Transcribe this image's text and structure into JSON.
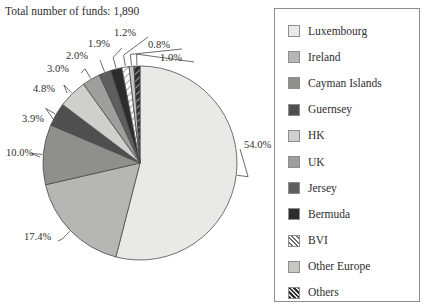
{
  "title": "Total number of funds: 1,890",
  "chart_data": {
    "type": "pie",
    "title": "Total number of funds: 1,890",
    "total_label": "Total number of funds",
    "total_value": "1,890",
    "legend_position": "right",
    "grid": false,
    "categories": [
      "Luxembourg",
      "Ireland",
      "Cayman Islands",
      "Guernsey",
      "HK",
      "UK",
      "Jersey",
      "Bermuda",
      "BVI",
      "Other Europe",
      "Others"
    ],
    "values": [
      54.0,
      17.4,
      10.0,
      3.9,
      4.8,
      3.0,
      2.0,
      1.9,
      1.2,
      0.8,
      1.0
    ],
    "value_labels": [
      "54.0%",
      "17.4%",
      "10.0%",
      "3.9%",
      "4.8%",
      "3.0%",
      "2.0%",
      "1.9%",
      "1.2%",
      "0.8%",
      "1.0%"
    ],
    "colors": [
      "#e9e9e7",
      "#b6b6b4",
      "#8f8f8d",
      "#4f4f4f",
      "#cfcfcd",
      "#9e9e9c",
      "#5e5e5e",
      "#2c2c2c",
      "#ffffff",
      "#c6c6c4",
      "#3a3a3a"
    ],
    "fills": [
      "solid",
      "solid",
      "solid",
      "solid",
      "solid",
      "solid",
      "solid",
      "solid",
      "hatch-light",
      "solid",
      "hatch-dark"
    ],
    "start_angle_deg": 0,
    "direction": "clockwise",
    "xlabel": "",
    "ylabel": ""
  },
  "legend": {
    "items": [
      {
        "label": "Luxembourg",
        "color": "#e9e9e7",
        "fill": "solid"
      },
      {
        "label": "Ireland",
        "color": "#b6b6b4",
        "fill": "solid"
      },
      {
        "label": "Cayman Islands",
        "color": "#8f8f8d",
        "fill": "solid"
      },
      {
        "label": "Guernsey",
        "color": "#4f4f4f",
        "fill": "solid"
      },
      {
        "label": "HK",
        "color": "#cfcfcd",
        "fill": "solid"
      },
      {
        "label": "UK",
        "color": "#9e9e9c",
        "fill": "solid"
      },
      {
        "label": "Jersey",
        "color": "#5e5e5e",
        "fill": "solid"
      },
      {
        "label": "Bermuda",
        "color": "#2c2c2c",
        "fill": "solid"
      },
      {
        "label": "BVI",
        "color": "#ffffff",
        "fill": "hatch-light"
      },
      {
        "label": "Other Europe",
        "color": "#c6c6c4",
        "fill": "solid"
      },
      {
        "label": "Others",
        "color": "#3a3a3a",
        "fill": "hatch-dark"
      }
    ]
  },
  "pct_labels": [
    {
      "text": "54.0%",
      "x": 244,
      "y": 139
    },
    {
      "text": "17.4%",
      "x": 24,
      "y": 231
    },
    {
      "text": "10.0%",
      "x": 6,
      "y": 147
    },
    {
      "text": "3.9%",
      "x": 22,
      "y": 113
    },
    {
      "text": "4.8%",
      "x": 33,
      "y": 83
    },
    {
      "text": "3.0%",
      "x": 47,
      "y": 63
    },
    {
      "text": "2.0%",
      "x": 66,
      "y": 50
    },
    {
      "text": "1.9%",
      "x": 88,
      "y": 38
    },
    {
      "text": "1.2%",
      "x": 114,
      "y": 27
    },
    {
      "text": "0.8%",
      "x": 148,
      "y": 39
    },
    {
      "text": "1.0%",
      "x": 160,
      "y": 52
    }
  ]
}
